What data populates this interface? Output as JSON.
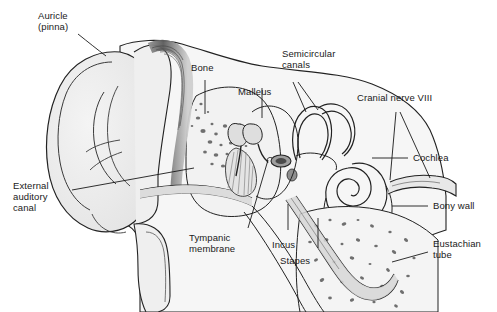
{
  "figure": {
    "background": "#ffffff",
    "line_color": "#222222",
    "fill_light": "#ebebeb",
    "fill_mid": "#d8d8d8",
    "fill_dark": "#9a9a9a",
    "text_color": "#1a1a1a"
  },
  "labels": {
    "auricle": "Auricle\n(pinna)",
    "bone": "Bone",
    "malleus": "Malleus",
    "semicircular_canals": "Semicircular\ncanals",
    "cranial_nerve": "Cranial nerve VIII",
    "cochlea": "Cochlea",
    "bony_wall": "Bony wall",
    "eustachian_tube": "Eustachian\ntube",
    "external_auditory_canal": "External\nauditory\ncanal",
    "tympanic_membrane": "Tympanic\nmembrane",
    "incus": "Incus",
    "stapes": "Stapes"
  }
}
